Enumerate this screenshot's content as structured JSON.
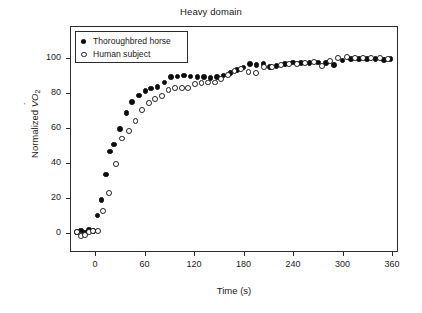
{
  "figure": {
    "width": 422,
    "height": 313,
    "background": "#ffffff",
    "title": "Heavy domain"
  },
  "axes": {
    "x_label": "Time (s)",
    "y_label_prefix": "Normalized ",
    "y_label_symbol": "V",
    "y_label_o": "O",
    "y_label_sub": "2",
    "x_ticks": [
      "0",
      "60",
      "120",
      "180",
      "240",
      "300",
      "360"
    ],
    "y_ticks": [
      "0",
      "20",
      "40",
      "60",
      "80",
      "100"
    ]
  },
  "legend": {
    "entries": [
      {
        "marker": "filled-circle",
        "label": "Thoroughbred horse"
      },
      {
        "marker": "open-circle",
        "label": "Human subject"
      }
    ]
  },
  "chart_data": {
    "type": "scatter",
    "title": "Heavy domain",
    "xlabel": "Time (s)",
    "ylabel": "Normalized VO2",
    "xlim": [
      -30,
      375
    ],
    "ylim": [
      -12,
      115
    ],
    "xticks": [
      0,
      60,
      120,
      180,
      240,
      300,
      360
    ],
    "yticks": [
      0,
      20,
      40,
      60,
      80,
      100
    ],
    "grid": false,
    "legend_position": "upper-left",
    "marker_colors": {
      "filled": "#0d0d0d",
      "open": "#ffffff",
      "open_edge": "#1a1a1a"
    },
    "series": [
      {
        "name": "Thoroughbred horse",
        "marker": "filled-circle",
        "points": [
          [
            -22,
            0.5
          ],
          [
            -17,
            1.5
          ],
          [
            -12,
            0.3
          ],
          [
            -7,
            1.8
          ],
          [
            -2,
            1.0
          ],
          [
            3,
            10.0
          ],
          [
            8,
            19.0
          ],
          [
            13,
            33.5
          ],
          [
            18,
            46.5
          ],
          [
            23,
            50.5
          ],
          [
            30,
            59.5
          ],
          [
            38,
            68.5
          ],
          [
            45,
            75.0
          ],
          [
            53,
            78.5
          ],
          [
            61,
            81.0
          ],
          [
            68,
            82.5
          ],
          [
            76,
            83.5
          ],
          [
            84,
            86.0
          ],
          [
            92,
            89.0
          ],
          [
            100,
            89.5
          ],
          [
            108,
            90.0
          ],
          [
            116,
            89.5
          ],
          [
            124,
            89.0
          ],
          [
            132,
            89.0
          ],
          [
            140,
            88.5
          ],
          [
            148,
            89.0
          ],
          [
            156,
            90.0
          ],
          [
            164,
            91.5
          ],
          [
            172,
            93.0
          ],
          [
            180,
            94.5
          ],
          [
            188,
            96.5
          ],
          [
            196,
            96.0
          ],
          [
            204,
            96.5
          ],
          [
            212,
            95.0
          ],
          [
            220,
            95.5
          ],
          [
            230,
            96.5
          ],
          [
            240,
            97.5
          ],
          [
            250,
            97.0
          ],
          [
            260,
            97.0
          ],
          [
            270,
            97.5
          ],
          [
            280,
            97.0
          ],
          [
            290,
            96.0
          ],
          [
            300,
            98.5
          ],
          [
            310,
            99.5
          ],
          [
            320,
            99.5
          ],
          [
            330,
            99.5
          ],
          [
            340,
            99.5
          ],
          [
            350,
            99.0
          ],
          [
            358,
            99.5
          ]
        ]
      },
      {
        "name": "Human subject",
        "marker": "open-circle",
        "points": [
          [
            -22,
            0.5
          ],
          [
            -17,
            -1.5
          ],
          [
            -12,
            -1.0
          ],
          [
            -7,
            0.5
          ],
          [
            -2,
            1.0
          ],
          [
            4,
            1.0
          ],
          [
            10,
            12.5
          ],
          [
            17,
            23.0
          ],
          [
            25,
            39.5
          ],
          [
            33,
            54.0
          ],
          [
            41,
            58.5
          ],
          [
            49,
            64.0
          ],
          [
            57,
            70.5
          ],
          [
            65,
            74.5
          ],
          [
            73,
            76.5
          ],
          [
            81,
            78.5
          ],
          [
            89,
            81.5
          ],
          [
            97,
            83.0
          ],
          [
            105,
            83.0
          ],
          [
            113,
            83.0
          ],
          [
            121,
            85.0
          ],
          [
            129,
            85.5
          ],
          [
            137,
            86.0
          ],
          [
            145,
            86.0
          ],
          [
            153,
            88.0
          ],
          [
            161,
            90.5
          ],
          [
            169,
            92.5
          ],
          [
            177,
            93.5
          ],
          [
            186,
            92.0
          ],
          [
            195,
            91.5
          ],
          [
            205,
            95.0
          ],
          [
            215,
            95.0
          ],
          [
            225,
            96.0
          ],
          [
            235,
            96.5
          ],
          [
            245,
            96.5
          ],
          [
            255,
            97.0
          ],
          [
            265,
            97.5
          ],
          [
            275,
            95.5
          ],
          [
            285,
            98.5
          ],
          [
            295,
            100.0
          ],
          [
            305,
            100.5
          ],
          [
            315,
            100.0
          ],
          [
            325,
            100.0
          ],
          [
            335,
            100.0
          ],
          [
            345,
            100.0
          ],
          [
            355,
            99.5
          ]
        ]
      }
    ]
  }
}
